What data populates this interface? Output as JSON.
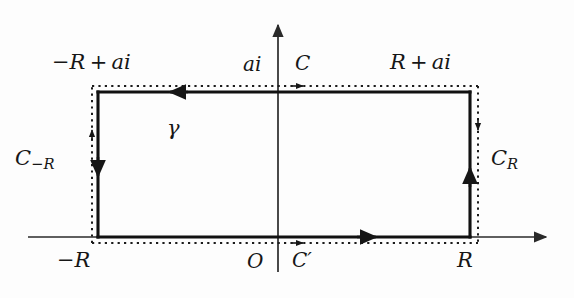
{
  "figure": {
    "type": "contour-diagram",
    "background_color": "#fdfdfd",
    "ink_color": "#161616"
  },
  "axes": {
    "x_axis_name": "real-axis",
    "y_axis_name": "imaginary-axis",
    "origin_label": "O",
    "x_axis_y": 237,
    "y_axis_x": 278,
    "x_axis_from": 28,
    "x_axis_to": 552,
    "y_axis_from": 272,
    "y_axis_to": 18
  },
  "rectangle": {
    "solid": {
      "left": 98,
      "right": 470,
      "top": 92,
      "bottom": 237
    },
    "dotted": {
      "left": 92,
      "right": 478,
      "top": 86,
      "bottom": 243
    }
  },
  "labels": {
    "top_left_vertex": {
      "text": "−R + ai",
      "minus": "−",
      "r": "R",
      "plus": "+",
      "ai": "ai"
    },
    "top_right_vertex": {
      "text": "R + ai",
      "r": "R",
      "plus": "+",
      "ai": "ai"
    },
    "top_axis_point": "ai",
    "top_contour": "C",
    "bottom_contour": "C′",
    "origin": "O",
    "bottom_left_vertex": {
      "text": "−R",
      "minus": "−",
      "r": "R"
    },
    "bottom_right_vertex": "R",
    "left_side": {
      "base": "C",
      "sub_minus": "−",
      "sub_r": "R",
      "text": "C−R"
    },
    "right_side": {
      "base": "C",
      "sub_r": "R",
      "text": "CR"
    },
    "interior_curve": "γ"
  },
  "arrows": {
    "top_edge_direction": "left",
    "bottom_edge_direction": "right",
    "left_edge_direction": "down",
    "right_edge_direction": "up",
    "dotted_top_direction": "right",
    "dotted_bottom_direction": "right",
    "dotted_left_direction": "up",
    "dotted_right_direction": "down"
  }
}
